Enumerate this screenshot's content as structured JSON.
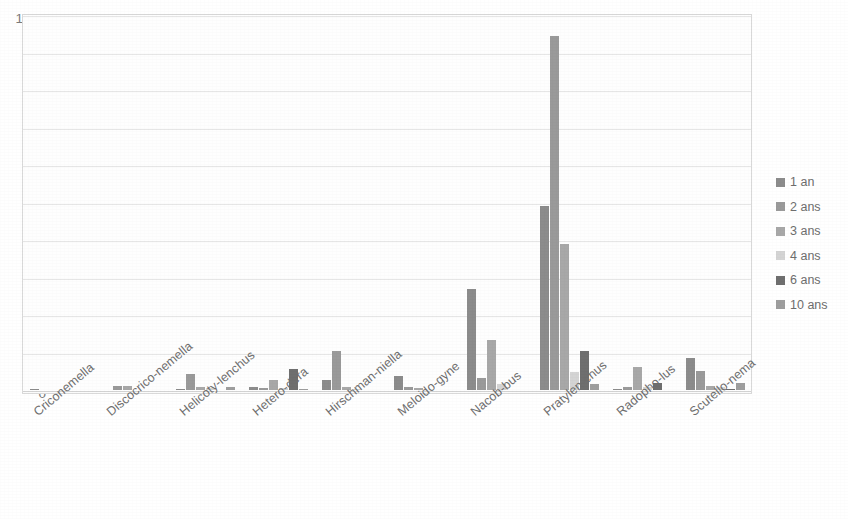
{
  "chart_data": {
    "type": "bar",
    "title": "",
    "subtitle": "",
    "xlabel": "",
    "ylabel": "",
    "ylim": [
      0,
      1000
    ],
    "ytick_values": [
      0,
      100,
      200,
      300,
      400,
      500,
      600,
      700,
      800,
      900,
      1000
    ],
    "ytick_labels": [
      "0",
      "100",
      "200",
      "300",
      "400",
      "500",
      "600",
      "700",
      "800",
      "900",
      "1000"
    ],
    "grid": true,
    "grid_axis": "y",
    "legend_position": "right",
    "categories": [
      "Criconemella",
      "Discocrico-nemella",
      "Helicoty-lenchus",
      "Hetero-dera",
      "Hirschman-niella",
      "Meloido-gyne",
      "Nacob-bus",
      "Pratylen-chus",
      "Radopho-lus",
      "Scutello-nema"
    ],
    "series": [
      {
        "name": "1 an",
        "color": "#8c8c8c",
        "values": [
          2,
          0,
          3,
          9,
          28,
          38,
          270,
          490,
          3,
          85
        ]
      },
      {
        "name": "2 ans",
        "color": "#9a9a9a",
        "values": [
          0,
          10,
          42,
          6,
          105,
          9,
          32,
          945,
          9,
          52
        ]
      },
      {
        "name": "3 ans",
        "color": "#a8a8a8",
        "values": [
          0,
          10,
          9,
          28,
          8,
          6,
          133,
          390,
          62,
          10
        ]
      },
      {
        "name": "4 ans",
        "color": "#d4d4d4",
        "values": [
          0,
          0,
          6,
          5,
          4,
          0,
          15,
          48,
          7,
          8
        ]
      },
      {
        "name": "6 ans",
        "color": "#6f6f6f",
        "values": [
          0,
          0,
          0,
          55,
          0,
          0,
          0,
          103,
          18,
          4
        ]
      },
      {
        "name": "10 ans",
        "color": "#9e9e9e",
        "values": [
          0,
          0,
          8,
          3,
          0,
          0,
          0,
          15,
          0,
          18
        ]
      }
    ]
  },
  "legend": {
    "items": [
      {
        "label": "1 an",
        "color": "#8c8c8c"
      },
      {
        "label": "2 ans",
        "color": "#9a9a9a"
      },
      {
        "label": "3 ans",
        "color": "#a8a8a8"
      },
      {
        "label": "4 ans",
        "color": "#d4d4d4"
      },
      {
        "label": "6 ans",
        "color": "#6f6f6f"
      },
      {
        "label": "10 ans",
        "color": "#9e9e9e"
      }
    ]
  }
}
